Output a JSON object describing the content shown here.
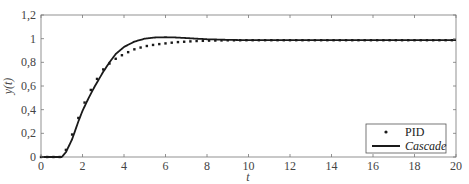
{
  "chart_data": {
    "type": "line",
    "title": "",
    "xlabel": "t",
    "ylabel": "y(t)",
    "xlim": [
      0,
      20
    ],
    "ylim": [
      0,
      1.2
    ],
    "xticks": [
      0,
      2,
      4,
      6,
      8,
      10,
      12,
      14,
      16,
      18,
      20
    ],
    "xtick_labels": [
      "0",
      "2",
      "4",
      "6",
      "8",
      "10",
      "12",
      "14",
      "16",
      "18",
      "20"
    ],
    "yticks": [
      0,
      0.2,
      0.4,
      0.6,
      0.8,
      1,
      1.2
    ],
    "ytick_labels": [
      "0",
      "0,2",
      "0,4",
      "0,6",
      "0,8",
      "1",
      "1,2"
    ],
    "grid": false,
    "legend_position": "lower right",
    "series": [
      {
        "name": "PID",
        "style": "dotted-markers",
        "color": "#1a1a1a",
        "x": [
          0,
          0.5,
          1.0,
          1.2,
          1.5,
          1.8,
          2.0,
          2.2,
          2.5,
          2.8,
          3.0,
          3.3,
          3.6,
          4.0,
          4.5,
          5.0,
          5.5,
          6.0,
          6.5,
          7.0,
          7.5,
          8.0,
          9.0,
          10,
          11,
          12,
          13,
          14,
          15,
          16,
          17,
          18,
          19,
          20
        ],
        "y": [
          0,
          0,
          0,
          0.06,
          0.19,
          0.33,
          0.42,
          0.5,
          0.6,
          0.69,
          0.74,
          0.79,
          0.83,
          0.87,
          0.91,
          0.935,
          0.95,
          0.96,
          0.97,
          0.975,
          0.98,
          0.983,
          0.986,
          0.987,
          0.987,
          0.987,
          0.987,
          0.987,
          0.987,
          0.987,
          0.987,
          0.987,
          0.987,
          0.987
        ]
      },
      {
        "name": "Cascade",
        "style": "solid",
        "color": "#1a1a1a",
        "x": [
          0,
          0.5,
          1.0,
          1.2,
          1.5,
          1.8,
          2.0,
          2.3,
          2.6,
          3.0,
          3.3,
          3.6,
          4.0,
          4.5,
          5.0,
          5.5,
          6.0,
          6.5,
          7.0,
          7.5,
          8.0,
          9.0,
          10,
          11,
          12,
          13,
          14,
          15,
          16,
          17,
          18,
          19,
          20
        ],
        "y": [
          0,
          0,
          0,
          0.04,
          0.15,
          0.3,
          0.39,
          0.5,
          0.6,
          0.72,
          0.8,
          0.87,
          0.93,
          0.975,
          1.0,
          1.01,
          1.012,
          1.01,
          1.005,
          1.0,
          0.995,
          0.99,
          0.987,
          0.987,
          0.987,
          0.987,
          0.987,
          0.987,
          0.987,
          0.987,
          0.987,
          0.987,
          0.987
        ]
      }
    ]
  },
  "legend": {
    "items": [
      {
        "label": "PID",
        "marker": "dot"
      },
      {
        "label": "Cascade",
        "marker": "line"
      }
    ]
  },
  "axes": {
    "xlabel": "t",
    "ylabel": "y(t)"
  }
}
